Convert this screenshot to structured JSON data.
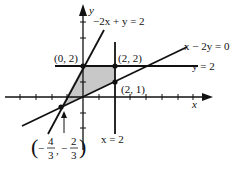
{
  "diagram": {
    "type": "linear-inequality-feasible-region",
    "axes": {
      "x_label": "x",
      "y_label": "y"
    },
    "lines": [
      {
        "equation": "-2x + y = 2",
        "label": "−2x + y = 2"
      },
      {
        "equation": "x - 2y = 0",
        "label": "x − 2y = 0"
      },
      {
        "equation": "y = 2",
        "label": "y = 2"
      },
      {
        "equation": "x = 2",
        "label": "x = 2"
      }
    ],
    "points": [
      {
        "label": "(0, 2)",
        "x": 0,
        "y": 2
      },
      {
        "label": "(2, 2)",
        "x": 2,
        "y": 2
      },
      {
        "label": "(2, 1)",
        "x": 2,
        "y": 1
      },
      {
        "label": "(-4/3, -2/3)",
        "x": -1.3333,
        "y": -0.6667
      }
    ],
    "intersection_label": {
      "x_num": "4",
      "x_den": "3",
      "y_num": "2",
      "y_den": "3",
      "minus": "−",
      "open": "(",
      "close": ")",
      "comma": ","
    },
    "shaded_region": "polygon (-4/3,-2/3), (0,2), (2,2), (2,1)",
    "colors": {
      "line": "#111111",
      "shade": "#c8c8c8"
    }
  }
}
